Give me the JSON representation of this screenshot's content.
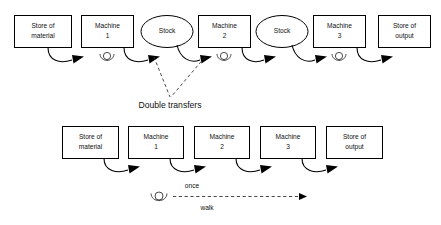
{
  "diagram": {
    "background_color": "#ffffff",
    "line_color": "#000000",
    "text_color": "#111111"
  },
  "top_row": {
    "nodes": [
      {
        "id": "store-material-top",
        "shape": "rect",
        "line1": "Store of",
        "line2": "material",
        "x": 14,
        "y": 15,
        "w": 57,
        "h": 32
      },
      {
        "id": "machine-1-top",
        "shape": "rect",
        "line1": "Machine",
        "line2": "1",
        "x": 81,
        "y": 15,
        "w": 52,
        "h": 32
      },
      {
        "id": "stock-1",
        "shape": "ellipse",
        "line1": "Stock",
        "line2": "",
        "x": 141,
        "y": 15,
        "w": 52,
        "h": 32
      },
      {
        "id": "machine-2-top",
        "shape": "rect",
        "line1": "Machine",
        "line2": "2",
        "x": 198,
        "y": 15,
        "w": 52,
        "h": 32
      },
      {
        "id": "stock-2",
        "shape": "ellipse",
        "line1": "Stock",
        "line2": "",
        "x": 256,
        "y": 15,
        "w": 52,
        "h": 32
      },
      {
        "id": "machine-3-top",
        "shape": "rect",
        "line1": "Machine",
        "line2": "3",
        "x": 313,
        "y": 15,
        "w": 52,
        "h": 32
      },
      {
        "id": "store-output-top",
        "shape": "rect",
        "line1": "Store of",
        "line2": "output",
        "x": 378,
        "y": 15,
        "w": 52,
        "h": 32
      }
    ],
    "workers": [
      {
        "id": "worker-top-machine-1",
        "cx": 107,
        "cy": 56
      },
      {
        "id": "worker-top-machine-2",
        "cx": 224,
        "cy": 56
      },
      {
        "id": "worker-top-machine-3",
        "cx": 339,
        "cy": 56
      }
    ]
  },
  "annotations": {
    "double_transfers": "Double transfers"
  },
  "bottom_row": {
    "nodes": [
      {
        "id": "store-material-bottom",
        "shape": "rect",
        "line1": "Store of",
        "line2": "material",
        "x": 62,
        "y": 126,
        "w": 56,
        "h": 32
      },
      {
        "id": "machine-1-bottom",
        "shape": "rect",
        "line1": "Machine",
        "line2": "1",
        "x": 128,
        "y": 126,
        "w": 55,
        "h": 32
      },
      {
        "id": "machine-2-bottom",
        "shape": "rect",
        "line1": "Machine",
        "line2": "2",
        "x": 194,
        "y": 126,
        "w": 55,
        "h": 32
      },
      {
        "id": "machine-3-bottom",
        "shape": "rect",
        "line1": "Machine",
        "line2": "3",
        "x": 260,
        "y": 126,
        "w": 55,
        "h": 32
      },
      {
        "id": "store-output-bottom",
        "shape": "rect",
        "line1": "Store of",
        "line2": "output",
        "x": 326,
        "y": 126,
        "w": 56,
        "h": 32
      }
    ]
  },
  "legend": {
    "worker": {
      "id": "worker-legend",
      "cx": 159,
      "cy": 196
    },
    "above_label": "once",
    "below_label": "walk"
  }
}
